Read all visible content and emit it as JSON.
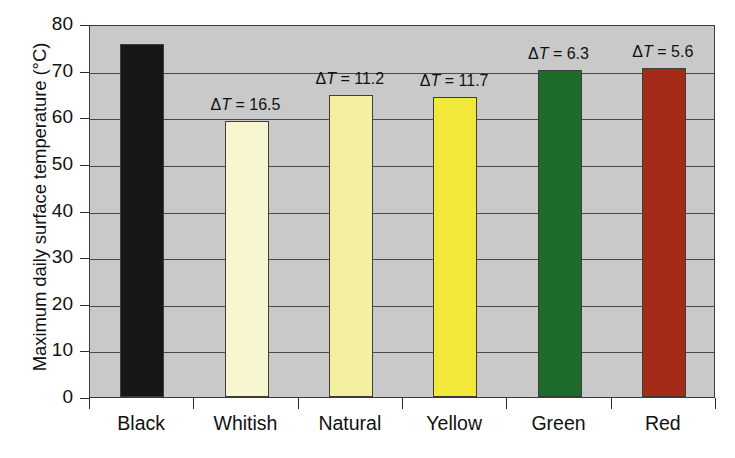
{
  "chart_data": {
    "type": "bar",
    "title": "",
    "xlabel": "",
    "ylabel": "Maximum daily surface temperature (°C)",
    "categories": [
      "Black",
      "Whitish",
      "Natural",
      "Yellow",
      "Green",
      "Red"
    ],
    "values": [
      75.7,
      59.3,
      64.8,
      64.4,
      70.2,
      70.5
    ],
    "ylim": [
      0,
      80
    ],
    "yticks": [
      0,
      10,
      20,
      30,
      40,
      50,
      60,
      70,
      80
    ],
    "ytick_labels": [
      "0",
      "10",
      "20",
      "30",
      "40",
      "50",
      "60",
      "70",
      "80"
    ],
    "grid": true,
    "legend": "none",
    "annotations": [
      {
        "category": "Black",
        "text": ""
      },
      {
        "category": "Whitish",
        "text": "ΔT = 16.5",
        "value": 16.5
      },
      {
        "category": "Natural",
        "text": "ΔT = 11.2",
        "value": 11.2
      },
      {
        "category": "Yellow",
        "text": "ΔT = 11.7",
        "value": 11.7
      },
      {
        "category": "Green",
        "text": "ΔT = 6.3",
        "value": 6.3
      },
      {
        "category": "Red",
        "text": "ΔT = 5.6",
        "value": 5.6
      }
    ],
    "bar_colors": [
      "#171717",
      "#f8f6cf",
      "#f4f0a0",
      "#f2e93a",
      "#1d6b2a",
      "#a32b17"
    ],
    "plot_background": "#c9c9c9",
    "axis_color": "#3a3a3a"
  },
  "annotation_parts": [
    {
      "delta": "",
      "tvar": "",
      "eq": "",
      "num": ""
    },
    {
      "delta": "Δ",
      "tvar": "T",
      "eq": " = ",
      "num": "16.5"
    },
    {
      "delta": "Δ",
      "tvar": "T",
      "eq": " = ",
      "num": "11.2"
    },
    {
      "delta": "Δ",
      "tvar": "T",
      "eq": " = ",
      "num": "11.7"
    },
    {
      "delta": "Δ",
      "tvar": "T",
      "eq": " = ",
      "num": "6.3"
    },
    {
      "delta": "Δ",
      "tvar": "T",
      "eq": " = ",
      "num": "5.6"
    }
  ],
  "caption": {
    "line": ""
  }
}
